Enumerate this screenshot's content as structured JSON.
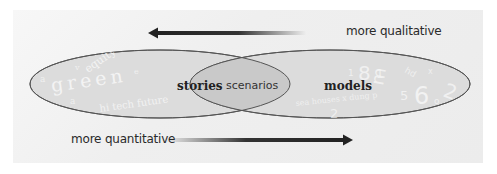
{
  "diagram": {
    "top_arrow": {
      "label": "more qualitative",
      "direction": "left"
    },
    "bottom_arrow": {
      "label": "more quantitative",
      "direction": "right"
    },
    "left_set": {
      "label": "stories",
      "ghost_words": [
        "equity",
        "green",
        "hi tech future"
      ]
    },
    "intersection": {
      "label": "scenarios"
    },
    "right_set": {
      "label": "models",
      "ghost_words": [
        "8",
        "1",
        "3",
        "5",
        "6",
        "2",
        "x",
        "hd",
        "sea houses x dung p"
      ]
    },
    "colors": {
      "panel": "#eeeeee",
      "ellipse_fill": "#dcdcdc",
      "intersection_fill": "#c9c9c9",
      "outline": "#555555",
      "arrow": "#222222",
      "ghost_text": "#f4f4f4"
    }
  }
}
